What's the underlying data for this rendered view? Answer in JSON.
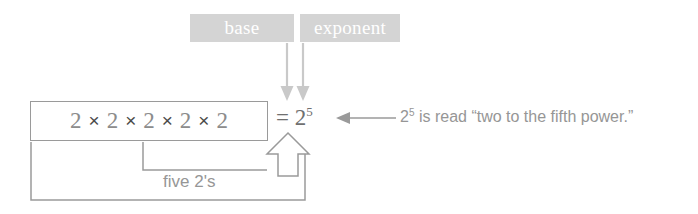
{
  "diagram": {
    "callouts": {
      "base_label": "base",
      "exponent_label": "exponent"
    },
    "equation": {
      "factor": "2",
      "times_symbol": "×",
      "factors": [
        "2",
        "2",
        "2",
        "2",
        "2"
      ],
      "equals_symbol": "=",
      "result_base": "2",
      "result_exponent": "5"
    },
    "annotations": {
      "count_label": "five 2's",
      "reading_prefix": "2",
      "reading_exponent": "5",
      "reading_text": " is read “two to the fifth power.”"
    },
    "colors": {
      "label_box_bg": "#d4d4d4",
      "label_text": "#ffffff",
      "arrow_gray": "#c9c9c9",
      "box_border": "#9a9a9a",
      "bracket_line": "#9a9a9a",
      "digit_gray": "#8c8c8c",
      "times_dark": "#4a4a4a",
      "body_text_gray": "#969696",
      "background": "#ffffff"
    },
    "icons": {
      "base_pointer": "down-arrow-icon",
      "exponent_pointer": "down-arrow-icon",
      "reading_pointer": "left-arrow-icon",
      "exponent_callout": "hollow-up-arrow-icon"
    }
  }
}
